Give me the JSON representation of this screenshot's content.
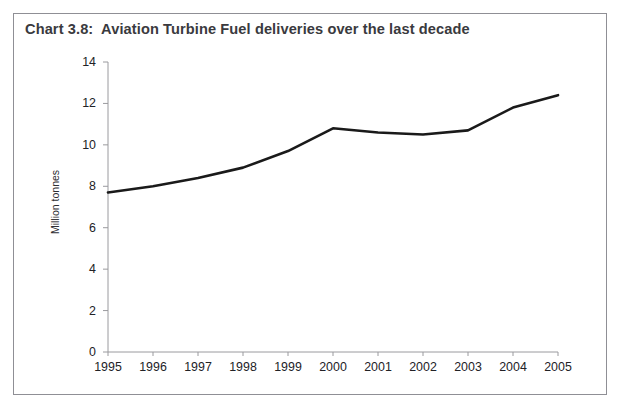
{
  "scan_artifact_text": "· · ▪ ·",
  "frame": {
    "border_color": "#8f8f95"
  },
  "title": "Chart 3.8:  Aviation Turbine Fuel deliveries over the last decade",
  "chart_data": {
    "type": "line",
    "title": "Chart 3.8:  Aviation Turbine Fuel deliveries over the last decade",
    "xlabel": "",
    "ylabel": "Million tonnes",
    "x": [
      "1995",
      "1996",
      "1997",
      "1998",
      "1999",
      "2000",
      "2001",
      "2002",
      "2003",
      "2004",
      "2005"
    ],
    "categories": [
      "1995",
      "1996",
      "1997",
      "1998",
      "1999",
      "2000",
      "2001",
      "2002",
      "2003",
      "2004",
      "2005"
    ],
    "values": [
      7.7,
      8.0,
      8.4,
      8.9,
      9.7,
      10.8,
      10.6,
      10.5,
      10.7,
      11.8,
      12.4
    ],
    "series": [
      {
        "name": "Aviation Turbine Fuel deliveries",
        "values": [
          7.7,
          8.0,
          8.4,
          8.9,
          9.7,
          10.8,
          10.6,
          10.5,
          10.7,
          11.8,
          12.4
        ],
        "color": "#1a1a1a"
      }
    ],
    "ylim": [
      0,
      14
    ],
    "yticks": [
      0,
      2,
      4,
      6,
      8,
      10,
      12,
      14
    ],
    "ytick_labels": [
      "0",
      "2",
      "4",
      "6",
      "8",
      "10",
      "12",
      "14"
    ],
    "xtick_labels": [
      "1995",
      "1996",
      "1997",
      "1998",
      "1999",
      "2000",
      "2001",
      "2002",
      "2003",
      "2004",
      "2005"
    ],
    "grid": false,
    "legend": "none",
    "line_color": "#1a1a1a",
    "line_width": 2.6,
    "axis_color": "#9a9a9e",
    "units": "Million tonnes"
  }
}
